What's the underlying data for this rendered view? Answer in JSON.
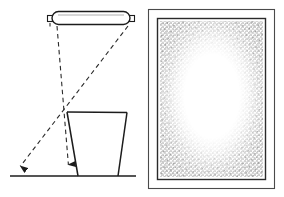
{
  "figure": {
    "background_color": "#ffffff",
    "ink_color": "#1c1c1c",
    "stipple_color": "#8a8a8a",
    "width": 284,
    "height": 197,
    "left_panel": {
      "name": "lamp-projection-diagram",
      "lamp": {
        "label": "fluorescent tube lamp",
        "x": 52,
        "y": 12,
        "width": 78,
        "height": 12,
        "end_cap_width": 5,
        "end_cap_height": 6
      },
      "rays": [
        {
          "label": "vertical projection ray",
          "style": "dashed",
          "x1": 57,
          "y1": 26,
          "x2": 69,
          "y2": 172,
          "arrow": true
        },
        {
          "label": "diagonal projection ray",
          "style": "dashed",
          "x1": 128,
          "y1": 26,
          "x2": 16,
          "y2": 172,
          "arrow": true
        }
      ],
      "vessel": {
        "label": "trapezoidal vessel",
        "top_left_x": 67,
        "top_right_x": 127,
        "top_y": 112,
        "bottom_left_x": 78,
        "bottom_right_x": 118,
        "bottom_y": 176
      },
      "ground_line": {
        "label": "ground baseline",
        "x1": 10,
        "y1": 176,
        "x2": 136,
        "y2": 176
      }
    },
    "right_panel": {
      "name": "illumination-pattern",
      "outer_frame": {
        "x": 148,
        "y": 9,
        "width": 127,
        "height": 180
      },
      "inner_frame": {
        "x": 157,
        "y": 18,
        "width": 109,
        "height": 162
      },
      "stipple_field": {
        "x": 160,
        "y": 21,
        "width": 103,
        "height": 156
      },
      "bright_center": {
        "cx": 212,
        "cy": 96,
        "rx": 31,
        "ry": 36
      }
    }
  }
}
